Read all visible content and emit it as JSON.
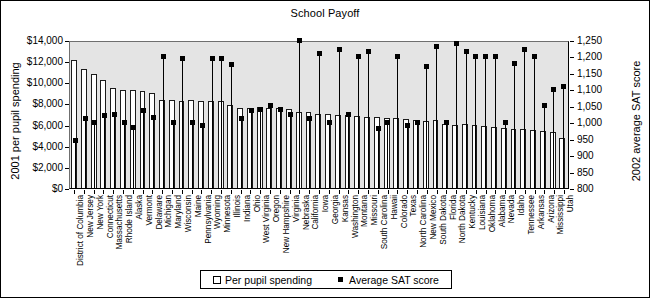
{
  "chart_data": {
    "type": "bar",
    "title": "School Payoff",
    "xlabel": "",
    "ylabel": "2001 per pupil spending",
    "y2label": "2002 average SAT score",
    "ylim": [
      0,
      14000
    ],
    "y2lim": [
      800,
      1250
    ],
    "grid": false,
    "legend_position": "bottom",
    "y_ticks": [
      "$0",
      "$2,000",
      "$4,000",
      "$6,000",
      "$8,000",
      "$10,000",
      "$12,000",
      "$14,000"
    ],
    "y2_ticks": [
      "800",
      "850",
      "900",
      "950",
      "1,000",
      "1,050",
      "1,100",
      "1,150",
      "1,200",
      "1,250"
    ],
    "categories": [
      "District of Columbia",
      "New Jersey",
      "New York",
      "Connecticut",
      "Massachusetts",
      "Rhode Island",
      "Alaska",
      "Vermont",
      "Delaware",
      "Michigan",
      "Maryland",
      "Wisconsin",
      "Maine",
      "Pennsylvania",
      "Wyoming",
      "Minnesota",
      "Illinois",
      "Indiana",
      "Ohio",
      "West Virginia",
      "Oregon",
      "New Hampshire",
      "Virginia",
      "Nebraska",
      "California",
      "Iowa",
      "Georgia",
      "Kansas",
      "Washington",
      "Montana",
      "Missouri",
      "South Carolina",
      "Hawaii",
      "Colorado",
      "Texas",
      "North Carolina",
      "New Mexico",
      "South Dakota",
      "Florida",
      "North Dakota",
      "Kentucky",
      "Louisiana",
      "Oklahoma",
      "Alabama",
      "Nevada",
      "Idaho",
      "Tennessee",
      "Arkansas",
      "Arizona",
      "Mississippi",
      "Utah"
    ],
    "series": [
      {
        "name": "Per pupil spending",
        "axis": "left",
        "kind": "bar",
        "values": [
          12100,
          11300,
          10800,
          10200,
          9500,
          9300,
          9250,
          9200,
          9000,
          8300,
          8300,
          8250,
          8300,
          8250,
          8200,
          8200,
          7900,
          7600,
          7600,
          7700,
          7600,
          7550,
          7500,
          7200,
          7200,
          7000,
          7000,
          6950,
          6950,
          6800,
          6750,
          6700,
          6600,
          6600,
          6500,
          6400,
          6350,
          6400,
          6100,
          6000,
          6100,
          6000,
          5900,
          5800,
          5700,
          5600,
          5600,
          5500,
          5400,
          5300,
          4700
        ]
      },
      {
        "name": "Average SAT score",
        "axis": "right",
        "kind": "point",
        "values": [
          945,
          1010,
          1000,
          1020,
          1025,
          1000,
          985,
          1035,
          1015,
          1200,
          1000,
          1195,
          1000,
          990,
          1195,
          1195,
          1175,
          1010,
          1035,
          1040,
          1050,
          1040,
          1025,
          1250,
          1010,
          1210,
          1000,
          1220,
          1025,
          1200,
          1215,
          980,
          1000,
          1200,
          990,
          1000,
          1170,
          1230,
          1000,
          1240,
          1215,
          1200,
          1200,
          1200,
          1000,
          1180,
          1220,
          1200,
          1050,
          1100,
          1110
        ]
      }
    ]
  },
  "legend": {
    "bar_label": "Per pupil spending",
    "point_label": "Average SAT score"
  }
}
